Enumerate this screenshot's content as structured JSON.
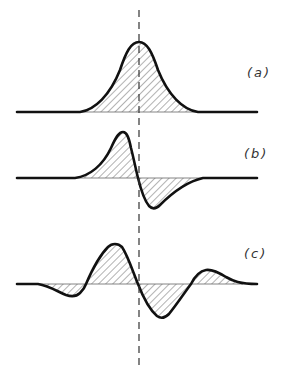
{
  "figure": {
    "panels": [
      {
        "label": "(a)",
        "name": "gaussian"
      },
      {
        "label": "(b)",
        "name": "first-derivative"
      },
      {
        "label": "(c)",
        "name": "second-derivative"
      }
    ],
    "colors": {
      "curve": "#111111",
      "hatch": "#555555",
      "dash": "#333333",
      "background": "#ffffff"
    }
  }
}
